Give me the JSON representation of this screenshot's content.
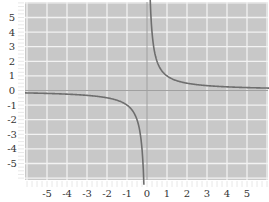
{
  "chart_data": {
    "type": "line",
    "title": "",
    "function": "y = 1/x",
    "xlabel": "",
    "ylabel": "",
    "xlim": [
      -6,
      6
    ],
    "ylim": [
      -6.2,
      6
    ],
    "grid": true,
    "legend": null,
    "x_ticks": [
      "-5",
      "-4",
      "-3",
      "-2",
      "-1",
      "0",
      "1",
      "2",
      "3",
      "4",
      "5"
    ],
    "y_ticks": [
      "5",
      "4",
      "3",
      "2",
      "1",
      "0",
      "-1",
      "-2",
      "-3",
      "-4",
      "-5"
    ],
    "series": [
      {
        "name": "1/x (x<0)",
        "x": [
          -6,
          -5,
          -4,
          -3,
          -2,
          -1.5,
          -1,
          -0.75,
          -0.5,
          -0.35,
          -0.25,
          -0.2,
          -0.16
        ],
        "values": [
          -0.17,
          -0.2,
          -0.25,
          -0.33,
          -0.5,
          -0.67,
          -1,
          -1.33,
          -2,
          -2.86,
          -4,
          -5,
          -6.2
        ]
      },
      {
        "name": "1/x (x>0)",
        "x": [
          0.16,
          0.2,
          0.25,
          0.35,
          0.5,
          0.75,
          1,
          1.5,
          2,
          3,
          4,
          5,
          6
        ],
        "values": [
          6.2,
          5,
          4,
          2.86,
          2,
          1.33,
          1,
          0.67,
          0.5,
          0.33,
          0.25,
          0.2,
          0.17
        ]
      }
    ]
  },
  "colors": {
    "plot_background": "#c8c8c8",
    "grid": "#f2f2f2",
    "axis": "#a0a0a0",
    "curve": "#6e6e6e",
    "tick_text": "#333333"
  }
}
